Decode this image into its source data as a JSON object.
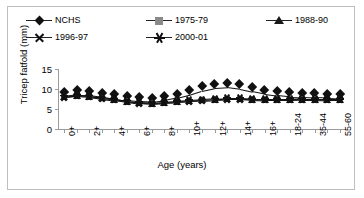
{
  "chart_data": {
    "type": "line",
    "title": "",
    "xlabel": "Age (years)",
    "ylabel": "Tricep fatfold (mm)",
    "ylim": [
      0,
      15
    ],
    "yticks": [
      0,
      5,
      10,
      15
    ],
    "grid": false,
    "legend_position": "top",
    "categories": [
      "0+",
      "1+",
      "2+",
      "3+",
      "4+",
      "5+",
      "6+",
      "7+",
      "8+",
      "9+",
      "10+",
      "11+",
      "12+",
      "13+",
      "14+",
      "15+",
      "16+",
      "17+",
      "18-24",
      "25-34",
      "35-44",
      "45-54",
      "55-60"
    ],
    "tick_labels": [
      "0+",
      "",
      "2+",
      "",
      "4+",
      "",
      "6+",
      "",
      "8+",
      "",
      "10+",
      "",
      "12+",
      "",
      "14+",
      "",
      "16+",
      "",
      "18-24",
      "",
      "35-44",
      "",
      "55-60"
    ],
    "series": [
      {
        "name": "NCHS",
        "marker": "diamond",
        "color": "#111111",
        "values": [
          8.2,
          8.6,
          8.4,
          8.0,
          7.6,
          7.2,
          6.9,
          6.8,
          7.2,
          7.8,
          8.6,
          9.6,
          10.3,
          10.5,
          10.1,
          9.4,
          8.8,
          8.4,
          8.1,
          8.0,
          7.9,
          7.8,
          7.7
        ]
      },
      {
        "name": "1975-79",
        "marker": "square",
        "color": "#8c8c8c",
        "values": [
          8.0,
          8.3,
          8.1,
          7.7,
          7.3,
          6.9,
          6.5,
          6.4,
          6.6,
          6.8,
          7.0,
          7.2,
          7.4,
          7.5,
          7.5,
          7.4,
          7.3,
          7.3,
          7.3,
          7.4,
          7.4,
          7.3,
          7.3
        ]
      },
      {
        "name": "1988-90",
        "marker": "triangle",
        "color": "#1c1c1c",
        "values": [
          8.1,
          8.4,
          8.2,
          7.8,
          7.4,
          7.0,
          6.6,
          6.5,
          6.7,
          6.9,
          7.1,
          7.3,
          7.5,
          7.6,
          7.6,
          7.5,
          7.4,
          7.4,
          7.4,
          7.5,
          7.5,
          7.4,
          7.4
        ]
      },
      {
        "name": "1996-97",
        "marker": "x",
        "color": "#111111",
        "values": [
          7.9,
          8.2,
          8.0,
          7.6,
          7.2,
          6.8,
          6.4,
          6.3,
          6.5,
          6.7,
          6.9,
          7.1,
          7.3,
          7.4,
          7.4,
          7.3,
          7.2,
          7.2,
          7.2,
          7.3,
          7.3,
          7.2,
          7.2
        ]
      },
      {
        "name": "2000-01",
        "marker": "star",
        "color": "#111111",
        "values": [
          8.3,
          8.5,
          8.3,
          7.9,
          7.5,
          7.1,
          6.7,
          6.6,
          6.8,
          7.0,
          7.2,
          7.4,
          7.6,
          7.7,
          7.7,
          7.6,
          7.5,
          7.5,
          7.5,
          7.6,
          7.6,
          7.5,
          7.5
        ]
      }
    ]
  },
  "legend": {
    "row1": [
      {
        "label": "NCHS",
        "marker": "diamond"
      },
      {
        "label": "1975-79",
        "marker": "square"
      },
      {
        "label": "1988-90",
        "marker": "triangle"
      }
    ],
    "row2": [
      {
        "label": "1996-97",
        "marker": "x"
      },
      {
        "label": "2000-01",
        "marker": "star"
      }
    ]
  }
}
